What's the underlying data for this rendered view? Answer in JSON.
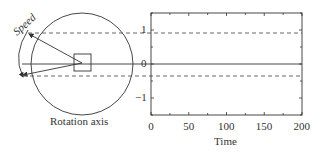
{
  "diagram": {
    "speed_label": "Speed",
    "rotation_axis_label": "Rotation axis"
  },
  "chart_data": {
    "type": "line",
    "title": "",
    "xlabel": "Time",
    "ylabel": "",
    "xlim": [
      0,
      200
    ],
    "ylim": [
      -1.5,
      1.5
    ],
    "x_ticks": [
      0,
      50,
      100,
      150,
      200
    ],
    "x_tick_labels": [
      "0",
      "50",
      "100",
      "150",
      "200"
    ],
    "y_ticks": [
      -1,
      0,
      1
    ],
    "y_tick_labels": [
      "−1",
      "0",
      "1"
    ],
    "grid": false,
    "series": [
      {
        "name": "zero-line",
        "style": "solid",
        "x": [
          0,
          200
        ],
        "y": [
          0,
          0
        ]
      },
      {
        "name": "upper-bound",
        "style": "dashed",
        "x": [
          0,
          200
        ],
        "y": [
          0.9,
          0.9
        ]
      },
      {
        "name": "lower-bound",
        "style": "dashed",
        "x": [
          0,
          200
        ],
        "y": [
          -0.35,
          -0.35
        ]
      }
    ]
  },
  "colors": {
    "line": "#333333",
    "dashed": "#555555"
  }
}
